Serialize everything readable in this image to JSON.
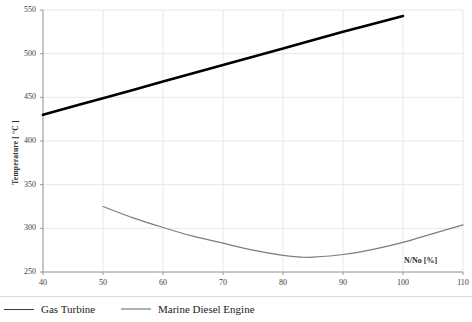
{
  "chart_data": {
    "type": "line",
    "title": "",
    "xlabel": "N/No  [%]",
    "ylabel": "Temperature [ °C ]",
    "xlim": [
      40,
      110
    ],
    "ylim": [
      250,
      550
    ],
    "xticks": [
      "40",
      "50",
      "60",
      "70",
      "80",
      "90",
      "100",
      "110"
    ],
    "yticks": [
      "250",
      "300",
      "350",
      "400",
      "450",
      "500",
      "550"
    ],
    "grid": true,
    "legend_position": "bottom",
    "series": [
      {
        "name": "Gas Turbine",
        "color": "#000000",
        "width": 2.6,
        "x": [
          40,
          50,
          60,
          70,
          80,
          90,
          100
        ],
        "values": [
          430,
          449,
          468,
          487,
          506,
          525,
          543
        ]
      },
      {
        "name": "Marine Diesel Engine",
        "color": "#7d7d7d",
        "width": 1.2,
        "x": [
          50,
          55,
          60,
          65,
          70,
          75,
          80,
          83,
          85,
          90,
          95,
          100,
          105,
          110
        ],
        "values": [
          325,
          312,
          301,
          291,
          283,
          275,
          269,
          267,
          267,
          270,
          276,
          284,
          294,
          304
        ]
      }
    ]
  },
  "annotations": {
    "xaxis_note": "N/No  [%]"
  },
  "legend": {
    "items": [
      {
        "label": "Gas Turbine",
        "color": "#3a3a3a"
      },
      {
        "label": "Marine Diesel Engine",
        "color": "#b0b0b0"
      }
    ]
  },
  "colors": {
    "grid": "#e2e2e2",
    "axis": "#9a9a9a",
    "text": "#3c3c3c",
    "gas_turbine": "#000000",
    "marine_diesel": "#7d7d7d"
  }
}
